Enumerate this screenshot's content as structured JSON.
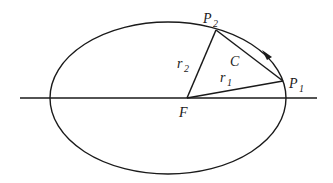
{
  "diagram": {
    "type": "orbit-ellipse",
    "colors": {
      "stroke": "#1a1a1a",
      "background": "#ffffff"
    },
    "labels": {
      "p2": "P",
      "p2_sub": "2",
      "p1": "P",
      "p1_sub": "1",
      "focus": "F",
      "chord": "C",
      "r1": "r",
      "r1_sub": "1",
      "r2": "r",
      "r2_sub": "2"
    },
    "geometry": {
      "ellipse": {
        "cx": 168,
        "cy": 98,
        "rx": 118,
        "ry": 76
      },
      "axis": {
        "x1": 20,
        "x2": 317,
        "y": 98
      },
      "focus": {
        "x": 187,
        "y": 98
      },
      "P1": {
        "x": 283,
        "y": 81
      },
      "P2": {
        "x": 216,
        "y": 30
      }
    },
    "arrow": {
      "direction": "counterclockwise",
      "position": "arc between P1 and P2"
    }
  }
}
